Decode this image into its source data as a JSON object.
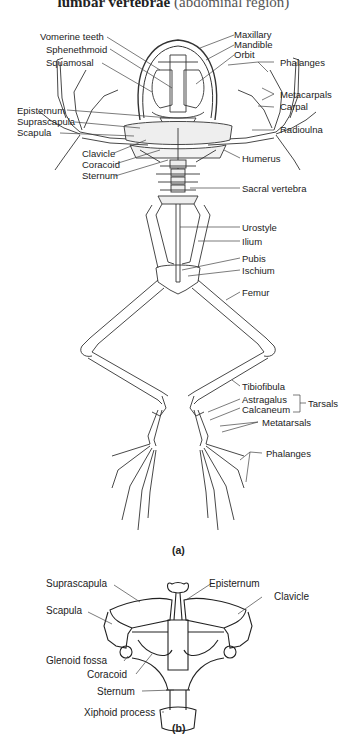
{
  "header": {
    "caption_bold": "lumbar vertebrae",
    "caption_rest": " (abdominal region)"
  },
  "figure_a": {
    "panel_label": "(a)",
    "labels_left": {
      "vomerine_teeth": "Vomerine teeth",
      "sphenethmoid": "Sphenethmoid",
      "squamosal": "Squamosal",
      "episternum": "Episternum",
      "suprascapula": "Suprascapula",
      "scapula": "Scapula",
      "clavicle": "Clavicle",
      "coracoid": "Coracoid",
      "sternum": "Sternum"
    },
    "labels_right": {
      "maxillary": "Maxillary",
      "mandible": "Mandible",
      "orbit": "Orbit",
      "phalanges_fore": "Phalanges",
      "metacarpals": "Metacarpals",
      "carpal": "Carpal",
      "radioulna": "Radioulna",
      "humerus": "Humerus",
      "sacral_vertebra": "Sacral vertebra",
      "urostyle": "Urostyle",
      "ilium": "Ilium",
      "pubis": "Pubis",
      "ischium": "Ischium",
      "femur": "Femur",
      "tibiofibula": "Tibiofibula",
      "astragalus": "Astragalus",
      "calcaneum": "Calcaneum",
      "tarsals": "Tarsals",
      "metatarsals": "Metatarsals",
      "phalanges_hind": "Phalanges"
    }
  },
  "figure_b": {
    "panel_label": "(b)",
    "labels": {
      "suprascapula": "Suprascapula",
      "scapula": "Scapula",
      "glenoid_fossa": "Glenoid fossa",
      "coracoid": "Coracoid",
      "sternum": "Sternum",
      "xiphoid_process": "Xiphoid process",
      "episternum": "Episternum",
      "clavicle": "Clavicle"
    }
  }
}
